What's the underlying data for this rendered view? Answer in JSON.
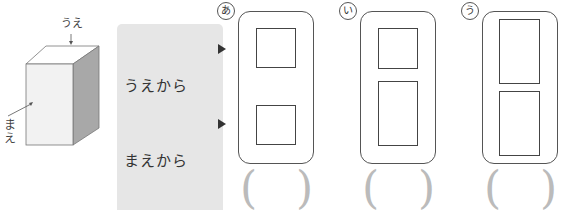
{
  "cube": {
    "top_label": "うえ",
    "front_label_line1": "ま",
    "front_label_line2": "え"
  },
  "views": [
    {
      "line1": "うえから",
      "line2": "みた  かたち",
      "arrow": "triangle-right-icon"
    },
    {
      "line1": "まえから",
      "line2": "みた  かたち",
      "arrow": "triangle-right-icon"
    }
  ],
  "choices": [
    {
      "mark": "あ",
      "answer": ""
    },
    {
      "mark": "い",
      "answer": ""
    },
    {
      "mark": "う",
      "answer": ""
    }
  ],
  "colors": {
    "label_bg": "#e6e6e6",
    "line": "#555555",
    "paren": "#bbbbbb",
    "cube_front": "#f2f2f2",
    "cube_top": "#ffffff",
    "cube_side": "#a8a8a8"
  }
}
